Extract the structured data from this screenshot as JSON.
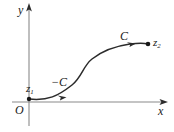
{
  "figure": {
    "canvas": {
      "width": 174,
      "height": 132,
      "background": "#ffffff"
    },
    "stroke_color": "#2b2b2b",
    "text_color": "#1a1a1a",
    "axes": {
      "y_axis": {
        "label": "y",
        "line": {
          "x": 29,
          "y_top": 6,
          "y_bottom": 126
        },
        "arrow": "up"
      },
      "x_axis": {
        "label": "x",
        "line": {
          "y": 102,
          "x_left": 12,
          "x_right": 166
        },
        "arrow": "right"
      },
      "origin_label": "O"
    },
    "points": [
      {
        "name": "z1",
        "label": "z",
        "subscript": "1",
        "x": 29,
        "y": 99
      },
      {
        "name": "z2",
        "label": "z",
        "subscript": "2",
        "x": 148,
        "y": 44
      }
    ],
    "curve": {
      "name": "contour",
      "path": "M 29 99 C 48 101, 58 96, 72 85 C 82 77, 83 66, 92 59 C 102 51, 116 46, 130 44 C 139 43, 144 43, 148 44",
      "arrow_markers": [
        {
          "name": "arrow-lower",
          "label": "-C",
          "at_x": 62,
          "at_y": 96
        },
        {
          "name": "arrow-upper",
          "label": "C",
          "at_x": 131,
          "at_y": 44
        }
      ]
    },
    "curve_labels": {
      "negative_orientation": "−C",
      "positive_orientation": "C"
    }
  }
}
